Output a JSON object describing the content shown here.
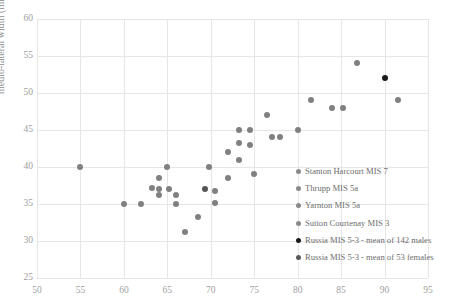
{
  "chart_data": {
    "type": "scatter",
    "title": "",
    "xlabel": "",
    "ylabel": "medio-lateral width (mm)",
    "xlim": [
      50,
      95
    ],
    "ylim": [
      25,
      60
    ],
    "xticks": [
      50,
      55,
      60,
      65,
      70,
      75,
      80,
      85,
      90,
      95
    ],
    "yticks": [
      25,
      30,
      35,
      40,
      45,
      50,
      55,
      60
    ],
    "grid": true,
    "legend_position": "inside-lower-right",
    "series": [
      {
        "name": "Stanton Harcourt MIS 7",
        "color": "#808080",
        "points": [
          [
            55.0,
            40.0
          ],
          [
            60.0,
            35.0
          ],
          [
            62.0,
            35.0
          ],
          [
            63.2,
            37.2
          ],
          [
            64.0,
            38.5
          ],
          [
            64.0,
            37.0
          ],
          [
            64.0,
            36.2
          ],
          [
            65.0,
            40.0
          ],
          [
            65.2,
            37.0
          ],
          [
            66.0,
            36.2
          ],
          [
            66.0,
            35.0
          ],
          [
            67.0,
            31.2
          ],
          [
            68.5,
            33.2
          ],
          [
            69.8,
            40.0
          ],
          [
            70.5,
            36.8
          ],
          [
            70.5,
            35.2
          ],
          [
            72.0,
            42.0
          ],
          [
            72.0,
            38.5
          ],
          [
            73.2,
            45.0
          ],
          [
            73.2,
            43.2
          ],
          [
            73.2,
            41.0
          ],
          [
            74.5,
            45.0
          ],
          [
            74.5,
            43.0
          ],
          [
            75.0,
            39.0
          ],
          [
            76.5,
            47.0
          ],
          [
            77.0,
            44.0
          ],
          [
            78.0,
            44.0
          ],
          [
            80.0,
            45.0
          ],
          [
            81.5,
            49.0
          ],
          [
            84.0,
            48.0
          ],
          [
            85.2,
            48.0
          ],
          [
            86.8,
            54.0
          ],
          [
            91.5,
            49.0
          ]
        ]
      },
      {
        "name": "Thrupp MIS 5a",
        "color": "#808080",
        "points": []
      },
      {
        "name": "Yarnton MIS 5a",
        "color": "#808080",
        "points": []
      },
      {
        "name": "Sutton Courtenay MIS 3",
        "color": "#808080",
        "points": []
      },
      {
        "name": "Russia MIS 5-3 - mean of 142 males",
        "color": "#1a1a1a",
        "points": [
          [
            90.0,
            52.0
          ]
        ]
      },
      {
        "name": "Russia MIS 5-3 - mean of 53 females",
        "color": "#555555",
        "points": [
          [
            69.3,
            37.0
          ]
        ]
      }
    ]
  },
  "legend": {
    "items": [
      {
        "label": "Stanton Harcourt MIS 7",
        "color": "#8a8a8a"
      },
      {
        "label": "Thrupp MIS 5a",
        "color": "#8a8a8a"
      },
      {
        "label": "Yarnton MIS 5a",
        "color": "#8a8a8a"
      },
      {
        "label": "Sutton Courtenay MIS 3",
        "color": "#8a8a8a"
      },
      {
        "label": "Russia MIS 5-3 - mean of 142 males",
        "color": "#1a1a1a"
      },
      {
        "label": "Russia MIS 5-3 - mean of 53 females",
        "color": "#5a5a5a"
      }
    ]
  },
  "colors": {
    "grid": "#e6e6e6",
    "axis": "#d0d0d0",
    "tick_text": "#a0a0a0",
    "axis_title": "#8c8c8c"
  }
}
